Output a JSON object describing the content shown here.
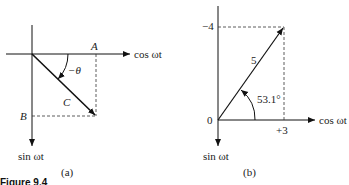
{
  "panel_a": {
    "x_axis_label": "cos ωt",
    "y_axis_label": "sin ωt",
    "point_A": "A",
    "point_B": "B",
    "vector_label": "C",
    "angle_label": "−θ",
    "caption": "(a)"
  },
  "panel_b": {
    "x_axis_label": "cos ωt",
    "y_axis_label": "sin ωt",
    "origin_label": "0",
    "y_tick_label": "−4",
    "x_tick_label": "+3",
    "magnitude_label": "5",
    "angle_label": "53.1°",
    "caption": "(b)"
  },
  "figure_caption": "Figure 9.4"
}
